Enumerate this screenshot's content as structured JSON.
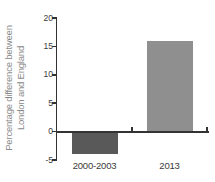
{
  "chart_data": {
    "type": "bar",
    "title": "",
    "categories": [
      "2000-2003",
      "2013"
    ],
    "values": [
      -4,
      16
    ],
    "series_colors": [
      "#595959",
      "#8f8f8f"
    ],
    "ylabel": "Percentage difference between London and England",
    "ylabel_lines": [
      "Percentage difference between",
      "London and England"
    ],
    "xlabel": "",
    "ylim": [
      -5,
      20
    ],
    "yticks": [
      20,
      15,
      10,
      5,
      0,
      -5
    ],
    "grid": false,
    "legend": "none"
  },
  "colors": {
    "background": "#ffffff",
    "axis": "#333333",
    "tick_label": "#3a3a3a",
    "ylabel_text": "#8a8a8a",
    "bar_2000_2003": "#595959",
    "bar_2013": "#8f8f8f"
  }
}
